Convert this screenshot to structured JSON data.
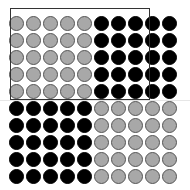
{
  "figure": {
    "rows": 10,
    "cols": 10,
    "origin": {
      "x": 16,
      "y": 23
    },
    "spacing": 17,
    "colors": {
      "gray_fill": "#a8a8a8",
      "gray_border": "#555555",
      "black_fill": "#000000",
      "frame_border": "#333333"
    },
    "quadrants": [
      {
        "name": "top-left",
        "rows": [
          0,
          4
        ],
        "cols": [
          0,
          4
        ],
        "color": "gray"
      },
      {
        "name": "top-right",
        "rows": [
          0,
          4
        ],
        "cols": [
          5,
          9
        ],
        "color": "black"
      },
      {
        "name": "bottom-left",
        "rows": [
          5,
          9
        ],
        "cols": [
          0,
          4
        ],
        "color": "black"
      },
      {
        "name": "bottom-right",
        "rows": [
          5,
          9
        ],
        "cols": [
          5,
          9
        ],
        "color": "gray"
      }
    ],
    "frame": {
      "left": 10,
      "top": 8,
      "width": 140,
      "height": 92
    }
  }
}
